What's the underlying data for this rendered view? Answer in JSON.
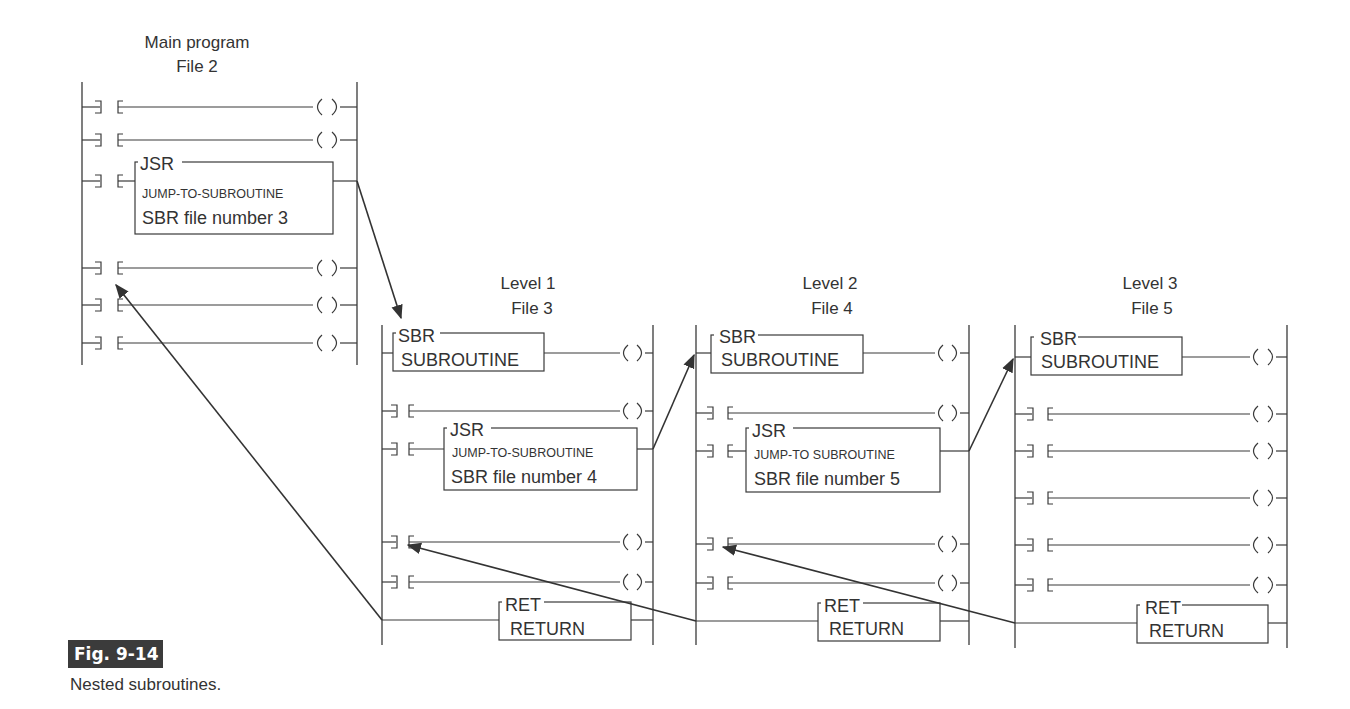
{
  "figure": {
    "number": "Fig. 9-14",
    "caption": "Nested subroutines."
  },
  "main_program": {
    "title_line1": "Main program",
    "title_line2": "File 2",
    "jsr": {
      "tag": "JSR",
      "name": "JUMP-TO-SUBROUTINE",
      "param": "SBR file number 3"
    }
  },
  "level1": {
    "title_line1": "Level 1",
    "title_line2": "File 3",
    "sbr": {
      "tag": "SBR",
      "name": "SUBROUTINE"
    },
    "jsr": {
      "tag": "JSR",
      "name": "JUMP-TO-SUBROUTINE",
      "param": "SBR file number 4"
    },
    "ret": {
      "tag": "RET",
      "name": "RETURN"
    }
  },
  "level2": {
    "title_line1": "Level 2",
    "title_line2": "File 4",
    "sbr": {
      "tag": "SBR",
      "name": "SUBROUTINE"
    },
    "jsr": {
      "tag": "JSR",
      "name": "JUMP-TO SUBROUTINE",
      "param": "SBR file number 5"
    },
    "ret": {
      "tag": "RET",
      "name": "RETURN"
    }
  },
  "level3": {
    "title_line1": "Level 3",
    "title_line2": "File 5",
    "sbr": {
      "tag": "SBR",
      "name": "SUBROUTINE"
    },
    "ret": {
      "tag": "RET",
      "name": "RETURN"
    }
  },
  "symbols": {
    "contact_left": "]",
    "contact_right": "[",
    "coil_left": "(",
    "coil_right": ")"
  }
}
